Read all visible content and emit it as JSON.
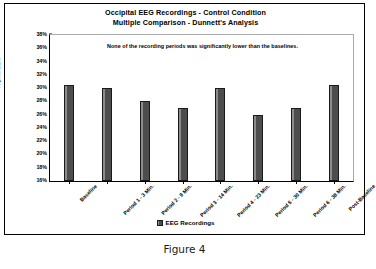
{
  "figure": {
    "caption": "Figure 4"
  },
  "chart_data": {
    "type": "bar",
    "title": "Occipital EEG Recordings - Control Condition",
    "subtitle": "Multiple Comparison - Dunnett's Analysis",
    "annotation": "None of the recording periods was significantly lower than the baselines.",
    "xlabel": "",
    "ylabel": "Alpha EEG",
    "categories": [
      "Baseline",
      "Period 1 - 3 Min.",
      "Period 2 - 9 Min.",
      "Period 3 - 14 Min.",
      "Period 4 - 23 Min.",
      "Period 5 - 30 Min.",
      "Period 6 - 38 Min.",
      "Post-Baseline"
    ],
    "values": [
      30.5,
      30.0,
      28.0,
      27.0,
      30.0,
      26.0,
      27.0,
      30.5
    ],
    "ylim": [
      16,
      38
    ],
    "ytick_labels": [
      "38%",
      "36%",
      "34%",
      "32%",
      "30%",
      "28%",
      "26%",
      "24%",
      "22%",
      "20%",
      "18%",
      "16%"
    ],
    "ytick_values": [
      38,
      36,
      34,
      32,
      30,
      28,
      26,
      24,
      22,
      20,
      18,
      16
    ],
    "grid": false,
    "legend": [
      {
        "label": "EEG Recordings",
        "color": "#595959"
      }
    ],
    "legend_position": "bottom",
    "bar_color": "#595959",
    "bar_edge_color": "#1a1a1a"
  }
}
